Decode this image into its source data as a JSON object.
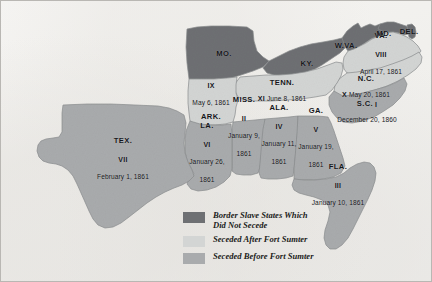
{
  "colors": {
    "border_state": "#6e7073",
    "seceded_after": "#d3d5d4",
    "seceded_before": "#a9abad",
    "background": "#f2f1ef",
    "text": "#15161a",
    "outline": "#8a8c8e"
  },
  "map": {
    "title": "Secession of the Southern States",
    "states": [
      {
        "id": "missouri",
        "abbr": "MO.",
        "roman": "",
        "date": "",
        "category": "border_state",
        "x": 223,
        "y": 53,
        "layout": "name-only"
      },
      {
        "id": "kentucky",
        "abbr": "KY.",
        "roman": "",
        "date": "",
        "category": "border_state",
        "x": 306,
        "y": 63,
        "layout": "name-only"
      },
      {
        "id": "west-virginia",
        "abbr": "W.VA.",
        "roman": "",
        "date": "",
        "category": "border_state",
        "x": 345,
        "y": 45,
        "layout": "name-only"
      },
      {
        "id": "maryland",
        "abbr": "MD.",
        "roman": "",
        "date": "",
        "category": "border_state",
        "x": 383,
        "y": 33,
        "layout": "name-only"
      },
      {
        "id": "delaware",
        "abbr": "DEL.",
        "roman": "",
        "date": "",
        "category": "border_state",
        "x": 408,
        "y": 31,
        "layout": "name-only"
      },
      {
        "id": "virginia",
        "abbr": "VA.",
        "roman": "VIII",
        "date": "April 17, 1861",
        "category": "seceded_after",
        "x": 380,
        "y": 54,
        "layout": "stacked"
      },
      {
        "id": "north-carolina",
        "abbr": "N.C.",
        "roman": "X",
        "date": "May 20, 1861",
        "category": "seceded_after",
        "x": 365,
        "y": 87,
        "layout": "name-then-inline"
      },
      {
        "id": "tennessee",
        "abbr": "TENN.",
        "roman": "XI",
        "date": "June 8, 1861",
        "category": "seceded_after",
        "x": 281,
        "y": 91,
        "layout": "name-then-inline"
      },
      {
        "id": "arkansas",
        "abbr": "ARK.",
        "roman": "IX",
        "date": "May 6, 1861",
        "category": "seceded_after",
        "x": 210,
        "y": 96,
        "layout": "date-above-name"
      },
      {
        "id": "south-carolina",
        "abbr": "S.C.",
        "roman": "I",
        "date": "December 20, 1860",
        "category": "seceded_before",
        "x": 366,
        "y": 112,
        "layout": "sc-special"
      },
      {
        "id": "mississippi",
        "abbr": "MISS.",
        "roman": "II",
        "date": "January 9,\n1861",
        "category": "seceded_before",
        "x": 243,
        "y": 126,
        "layout": "stacked"
      },
      {
        "id": "alabama",
        "abbr": "ALA.",
        "roman": "IV",
        "date": "January 11,\n1861",
        "category": "seceded_before",
        "x": 278,
        "y": 134,
        "layout": "stacked"
      },
      {
        "id": "georgia",
        "abbr": "GA.",
        "roman": "V",
        "date": "January 19,\n1861",
        "category": "seceded_before",
        "x": 315,
        "y": 137,
        "layout": "stacked"
      },
      {
        "id": "louisiana",
        "abbr": "LA.",
        "roman": "VI",
        "date": "January 26,\n1861",
        "category": "seceded_before",
        "x": 206,
        "y": 152,
        "layout": "stacked"
      },
      {
        "id": "texas",
        "abbr": "TEX.",
        "roman": "VII",
        "date": "February 1, 1861",
        "category": "seceded_before",
        "x": 122,
        "y": 159,
        "layout": "stacked"
      },
      {
        "id": "florida",
        "abbr": "FLA.",
        "roman": "III",
        "date": "January 10, 1861",
        "category": "seceded_before",
        "x": 337,
        "y": 185,
        "layout": "stacked"
      }
    ]
  },
  "legend": {
    "items": [
      {
        "id": "border-slave",
        "swatch": "#6e7073",
        "label": "Border Slave States Which\nDid Not Secede"
      },
      {
        "id": "after-sumter",
        "swatch": "#d3d5d4",
        "label": "Seceded After Fort Sumter"
      },
      {
        "id": "before-sumter",
        "swatch": "#a9abad",
        "label": "Seceded Before Fort Sumter"
      }
    ]
  }
}
